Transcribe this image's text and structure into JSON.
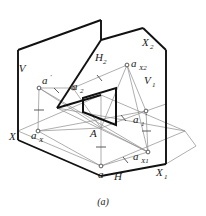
{
  "figure": {
    "caption": "(a)",
    "colors": {
      "heavy_line": "#111111",
      "light_line": "#8d8d8d",
      "text": "#1a1a1a",
      "background": "#ffffff",
      "point_fill": "#ffffff"
    }
  },
  "labels": {
    "plane_V": {
      "text": "V",
      "x": 22,
      "y": 68
    },
    "plane_H": {
      "text": "H",
      "x": 118,
      "y": 176
    },
    "plane_H2": {
      "text": "H",
      "sub": "2",
      "x": 97,
      "y": 57
    },
    "plane_V1": {
      "text": "V",
      "sub": "1",
      "x": 146,
      "y": 80
    },
    "axis_X": {
      "text": "X",
      "x": 12,
      "y": 136
    },
    "axis_X1": {
      "text": "X",
      "sub": "1",
      "x": 158,
      "y": 172
    },
    "axis_X2": {
      "text": "X",
      "sub": "2",
      "x": 144,
      "y": 42
    },
    "point_A": {
      "text": "A",
      "x": 92,
      "y": 133
    },
    "point_a": {
      "text": "a",
      "x": 100,
      "y": 176
    },
    "point_a_prime": {
      "text": "a",
      "prime": "'",
      "x": 42,
      "y": 84
    },
    "point_a1_prime": {
      "text": "a",
      "sub": "1",
      "prime": "'",
      "x": 136,
      "y": 123
    },
    "point_a2": {
      "text": "a",
      "sub": "2",
      "x": 76,
      "y": 85
    },
    "point_aX": {
      "text": "a",
      "sub": "X",
      "x": 34,
      "y": 136
    },
    "point_aX1": {
      "text": "a",
      "sub": "X1",
      "x": 137,
      "y": 158
    },
    "point_aX2": {
      "text": "a",
      "sub": "X2",
      "x": 131,
      "y": 66
    }
  },
  "geometry": {
    "points": {
      "a_prime": [
        39,
        88
      ],
      "a2": [
        73,
        88
      ],
      "aX2": [
        127,
        65
      ],
      "a1_prime": [
        146,
        111
      ],
      "A": [
        101,
        128
      ],
      "a": [
        101,
        166
      ],
      "aX": [
        38,
        131
      ],
      "aX1": [
        148,
        152
      ]
    },
    "tick_count": 6
  }
}
